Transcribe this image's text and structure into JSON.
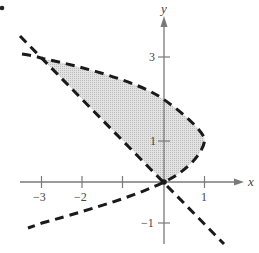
{
  "diagram": {
    "marker": "•",
    "axes": {
      "x_label": "x",
      "y_label": "y",
      "x_ticks": [
        {
          "value": -3,
          "label": "−3"
        },
        {
          "value": -2,
          "label": "−2"
        },
        {
          "value": -1,
          "label": ""
        },
        {
          "value": 1,
          "label": "1"
        }
      ],
      "y_ticks": [
        {
          "value": 3,
          "label": "3"
        },
        {
          "value": 1,
          "label": "1"
        },
        {
          "value": -1,
          "label": "−1"
        }
      ]
    },
    "curves": [
      {
        "name": "parabola",
        "equation": "x = 2y - y^2",
        "style": "dashed",
        "color": "#1a1a1a"
      },
      {
        "name": "line",
        "equation": "y = -x",
        "style": "dashed",
        "color": "#1a1a1a"
      }
    ],
    "intersections": [
      {
        "x": 0,
        "y": 0
      },
      {
        "x": -3,
        "y": 3
      }
    ],
    "region": {
      "fill": "#d4d4d4",
      "between": "y = -x and x = 2y - y^2, for 0 ≤ y ≤ 3"
    },
    "colors": {
      "axis": "#777777",
      "curve": "#1a1a1a",
      "fill": "#d6d6d6",
      "text": "#444444"
    }
  }
}
